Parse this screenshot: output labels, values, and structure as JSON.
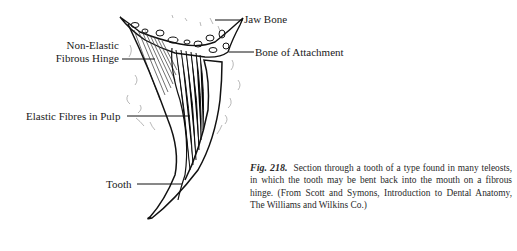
{
  "figure": {
    "labels": {
      "jaw_bone": "Jaw Bone",
      "bone_of_attachment": "Bone of Attachment",
      "non_elastic_line1": "Non-Elastic",
      "non_elastic_line2": "Fibrous Hinge",
      "elastic_fibres": "Elastic Fibres in Pulp",
      "tooth": "Tooth"
    },
    "caption": {
      "fig_number": "Fig. 218.",
      "text": "Section through a tooth of a type found in many teleosts, in which the tooth may be bent back into the mouth on a fibrous hinge. (From Scott and Symons, Introduction to Dental Anatomy, The Williams and Wilkins Co.)"
    }
  }
}
